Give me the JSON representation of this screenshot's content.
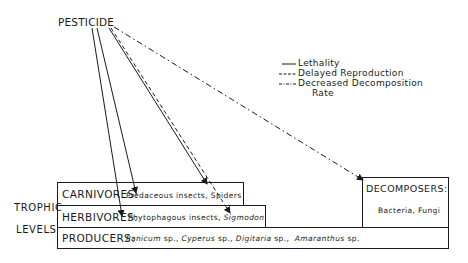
{
  "source": "PESTICIDE",
  "legend": [
    {
      "style": "solid",
      "label": "Lethality"
    },
    {
      "style": "dashed",
      "label": "Delayed Reproduction"
    },
    {
      "style": "dash-dot",
      "label": "Decreased Decomposition",
      "label2": "Rate"
    }
  ],
  "side_labels": {
    "line1": "TROPHIC",
    "line2": "LEVELS"
  },
  "levels": {
    "carnivores": {
      "title": "CARNIVORES:",
      "desc": "Predaceous insects, Spiders"
    },
    "herbivores": {
      "title": "HERBIVORES:",
      "desc_plain": "Phytophagous insects, ",
      "desc_italic": "Sigmodon"
    },
    "producers": {
      "title": "PRODUCERS:",
      "species": [
        {
          "genus": "Panicum",
          "suffix": " sp.,"
        },
        {
          "genus": "Cyperus",
          "suffix": " sp.,"
        },
        {
          "genus": "Digitaria",
          "suffix": " sp.,"
        },
        {
          "genus": "Amaranthus",
          "suffix": " sp."
        }
      ]
    },
    "decomposers": {
      "title": "DECOMPOSERS:",
      "desc": "Bacteria, Fungi"
    }
  },
  "effects": [
    {
      "target": "herbivores",
      "style": "solid"
    },
    {
      "target": "carnivores",
      "style": "solid"
    },
    {
      "target": "carnivores",
      "style": "solid"
    },
    {
      "target": "herbivores",
      "style": "dashed"
    },
    {
      "target": "decomposers",
      "style": "dash-dot"
    }
  ]
}
